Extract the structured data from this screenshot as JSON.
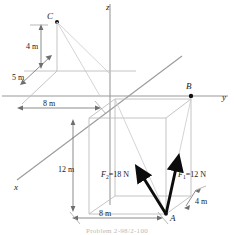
{
  "figure": {
    "type": "engineering-statics-diagram",
    "axes": {
      "x_label": "x",
      "y_label": "y",
      "z_label": "z"
    },
    "points": {
      "A": "A",
      "B": "B",
      "C": "C"
    },
    "dimensions": {
      "c_height": "4 m",
      "c_offset": "5 m",
      "y_to_box": "8 m",
      "box_height": "12 m",
      "box_width": "8 m",
      "box_depth": "4 m"
    },
    "forces": [
      {
        "name": "F",
        "subscript": "2",
        "equals": "=18 N",
        "magnitude": 18,
        "unit": "N",
        "full_label": "F2 =18 N"
      },
      {
        "name": "F",
        "subscript": "1",
        "equals": "=12 N",
        "magnitude": 12,
        "unit": "N",
        "full_label": "F1 =12 N"
      }
    ],
    "caption": "Problem 2-98/2-100",
    "colors": {
      "line": "#8c8c8c",
      "heavy": "#111111",
      "text": "#1a1a1a",
      "caption": "#b9b9b9"
    }
  }
}
